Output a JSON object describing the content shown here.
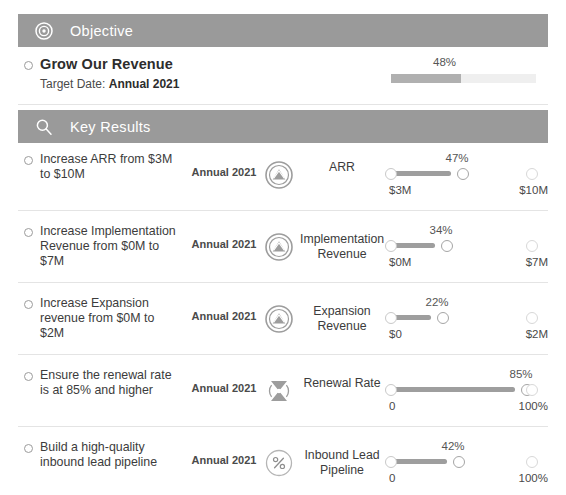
{
  "objective_section": {
    "icon": "target-icon",
    "label": "Objective",
    "bar_color": "#9a9a9a",
    "objective": {
      "title": "Grow Our Revenue",
      "target_date_label": "Target Date:",
      "target_date_value": "Annual 2021",
      "progress_percent_label": "48%",
      "progress_percent": 48
    }
  },
  "key_results_section": {
    "icon": "magnifier-icon",
    "label": "Key Results",
    "bar_color": "#9a9a9a",
    "rows": [
      {
        "description": "Increase ARR from $3M to $10M",
        "period": "Annual 2021",
        "icon": "chart-up-circle-icon",
        "metric": "ARR",
        "percent_label": "47%",
        "percent": 47,
        "track_width": 60,
        "min_label": "$3M",
        "max_label": "$10M"
      },
      {
        "description": "Increase Implementation Revenue from $0M to $7M",
        "period": "Annual 2021",
        "icon": "chart-up-circle-icon",
        "metric": "Implementation Revenue",
        "percent_label": "34%",
        "percent": 34,
        "track_width": 44,
        "min_label": "$0M",
        "max_label": "$7M"
      },
      {
        "description": "Increase Expansion revenue from $0M to $2M",
        "period": "Annual 2021",
        "icon": "chart-up-circle-icon",
        "metric": "Expansion Revenue",
        "percent_label": "22%",
        "percent": 22,
        "track_width": 40,
        "min_label": "$0",
        "max_label": "$2M"
      },
      {
        "description": "Ensure the renewal rate is at 85% and higher",
        "period": "Annual 2021",
        "icon": "signal-circle-icon",
        "metric": "Renewal Rate",
        "percent_label": "85%",
        "percent": 85,
        "track_width": 124,
        "min_label": "0",
        "max_label": "100%"
      },
      {
        "description": "Build a high-quality inbound lead pipeline",
        "period": "Annual 2021",
        "icon": "percent-circle-icon",
        "metric": "Inbound Lead Pipeline",
        "percent_label": "42%",
        "percent": 42,
        "track_width": 56,
        "min_label": "0",
        "max_label": "100%"
      }
    ]
  }
}
